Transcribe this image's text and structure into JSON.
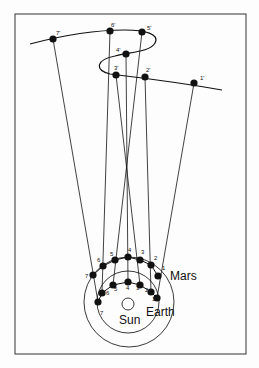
{
  "diagram": {
    "labels": {
      "mars": "Mars",
      "earth": "Earth",
      "sun": "Sun"
    },
    "sky_positions": [
      "1'",
      "2'",
      "3'",
      "4'",
      "5'",
      "6'",
      "7'"
    ],
    "mars_positions": [
      "1",
      "2",
      "3",
      "4",
      "5",
      "6",
      "7"
    ],
    "earth_positions": [
      "1",
      "2",
      "3",
      "4",
      "5",
      "6",
      "7"
    ],
    "colors": {
      "ink": "#111111",
      "background": "#fdfdfd"
    }
  }
}
